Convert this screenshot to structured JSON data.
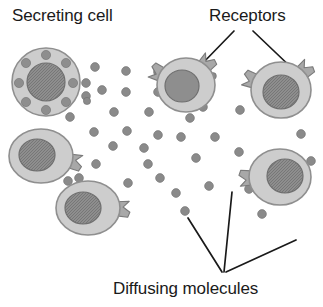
{
  "figure": {
    "background_color": "#ffffff",
    "width": 323,
    "height": 307
  },
  "labels": {
    "secreting_cell": "Secreting cell",
    "receptors": "Receptors",
    "diffusing_molecules": "Diffusing molecules"
  },
  "colors": {
    "cytoplasm_fill": "#cdcdcd",
    "cytoplasm_stroke": "#8f8f8f",
    "nucleus_fill": "#8e8e8e",
    "nucleus_stroke": "#6f6f6f",
    "vesicle_fill": "#8e8e8e",
    "molecule_fill": "#8a8a8a",
    "receptor_fill": "#a8a8a8",
    "receptor_stroke": "#7a7a7a",
    "leader_line": "#1a1a1a",
    "text": "#1a1a1a"
  },
  "chart_data": {
    "type": "diagram",
    "annotations": [
      {
        "text": "Secreting cell",
        "x": 12,
        "y": 6,
        "points_to": "secreting-cell"
      },
      {
        "text": "Receptors",
        "x": 209,
        "y": 6,
        "points_to": "receptors"
      },
      {
        "text": "Diffusing molecules",
        "x": 113,
        "y": 279,
        "points_to": "molecules"
      }
    ],
    "cells": [
      {
        "id": "secreting-cell",
        "role": "secreting",
        "cx": 46,
        "cy": 82,
        "rx": 34,
        "ry": 34,
        "nucleus": {
          "cx": 46,
          "cy": 82,
          "rx": 19,
          "ry": 19,
          "hatched": true
        },
        "vesicles": [
          {
            "cx": 46,
            "cy": 55,
            "r": 4.6
          },
          {
            "cx": 66,
            "cy": 63,
            "r": 4.6
          },
          {
            "cx": 73,
            "cy": 83,
            "r": 4.6
          },
          {
            "cx": 66,
            "cy": 102,
            "r": 4.6
          },
          {
            "cx": 46,
            "cy": 110,
            "r": 4.6
          },
          {
            "cx": 26,
            "cy": 102,
            "r": 4.6
          },
          {
            "cx": 19,
            "cy": 83,
            "r": 4.6
          },
          {
            "cx": 26,
            "cy": 63,
            "r": 4.6
          }
        ],
        "receptors": []
      },
      {
        "id": "target-cell-top-middle",
        "role": "target",
        "cx": 186,
        "cy": 85,
        "rx": 29,
        "ry": 27,
        "nucleus": {
          "cx": 182,
          "cy": 86,
          "rx": 17,
          "ry": 16,
          "hatched": false
        },
        "receptors": [
          {
            "angle": -48
          },
          {
            "angle": 205
          }
        ]
      },
      {
        "id": "target-cell-top-right",
        "role": "target",
        "cx": 281,
        "cy": 90,
        "rx": 30,
        "ry": 28,
        "nucleus": {
          "cx": 281,
          "cy": 92,
          "rx": 18,
          "ry": 17,
          "hatched": true
        },
        "receptors": [
          {
            "angle": -42
          },
          {
            "angle": 200
          }
        ]
      },
      {
        "id": "target-cell-mid-left",
        "role": "target",
        "cx": 41,
        "cy": 156,
        "rx": 32,
        "ry": 27,
        "nucleus": {
          "cx": 37,
          "cy": 155,
          "rx": 18,
          "ry": 16,
          "hatched": true
        },
        "receptors": [
          {
            "angle": 12
          }
        ]
      },
      {
        "id": "target-cell-bottom-left",
        "role": "target",
        "cx": 88,
        "cy": 208,
        "rx": 32,
        "ry": 27,
        "nucleus": {
          "cx": 83,
          "cy": 208,
          "rx": 18,
          "ry": 16,
          "hatched": true
        },
        "receptors": [
          {
            "angle": 2
          }
        ]
      },
      {
        "id": "target-cell-bottom-right",
        "role": "target",
        "cx": 280,
        "cy": 177,
        "rx": 31,
        "ry": 28,
        "nucleus": {
          "cx": 285,
          "cy": 176,
          "rx": 18,
          "ry": 17,
          "hatched": true
        },
        "receptors": [
          {
            "angle": 178
          }
        ]
      }
    ],
    "molecules": [
      {
        "cx": 95,
        "cy": 67,
        "r": 4.4
      },
      {
        "cx": 126,
        "cy": 71,
        "r": 4.4
      },
      {
        "cx": 158,
        "cy": 72,
        "r": 4.4
      },
      {
        "cx": 86,
        "cy": 83,
        "r": 4.4
      },
      {
        "cx": 102,
        "cy": 90,
        "r": 4.4
      },
      {
        "cx": 86,
        "cy": 96,
        "r": 4.4
      },
      {
        "cx": 87,
        "cy": 101,
        "r": 3.6
      },
      {
        "cx": 126,
        "cy": 92,
        "r": 4.4
      },
      {
        "cx": 158,
        "cy": 92,
        "r": 4.4
      },
      {
        "cx": 70,
        "cy": 117,
        "r": 4.4
      },
      {
        "cx": 114,
        "cy": 112,
        "r": 4.4
      },
      {
        "cx": 149,
        "cy": 112,
        "r": 4.4
      },
      {
        "cx": 190,
        "cy": 118,
        "r": 4.4
      },
      {
        "cx": 203,
        "cy": 107,
        "r": 4.4
      },
      {
        "cx": 240,
        "cy": 110,
        "r": 4.4
      },
      {
        "cx": 94,
        "cy": 132,
        "r": 4.4
      },
      {
        "cx": 127,
        "cy": 131,
        "r": 4.4
      },
      {
        "cx": 158,
        "cy": 135,
        "r": 4.4
      },
      {
        "cx": 181,
        "cy": 137,
        "r": 4.4
      },
      {
        "cx": 215,
        "cy": 137,
        "r": 4.4
      },
      {
        "cx": 301,
        "cy": 134,
        "r": 4.4
      },
      {
        "cx": 113,
        "cy": 146,
        "r": 4.4
      },
      {
        "cx": 144,
        "cy": 148,
        "r": 4.4
      },
      {
        "cx": 96,
        "cy": 164,
        "r": 4.4
      },
      {
        "cx": 148,
        "cy": 164,
        "r": 4.4
      },
      {
        "cx": 160,
        "cy": 178,
        "r": 4.4
      },
      {
        "cx": 196,
        "cy": 158,
        "r": 4.4
      },
      {
        "cx": 239,
        "cy": 152,
        "r": 4.4
      },
      {
        "cx": 128,
        "cy": 183,
        "r": 4.4
      },
      {
        "cx": 176,
        "cy": 193,
        "r": 4.4
      },
      {
        "cx": 209,
        "cy": 186,
        "r": 4.4
      },
      {
        "cx": 249,
        "cy": 189,
        "r": 4.4
      },
      {
        "cx": 185,
        "cy": 211,
        "r": 4.4
      },
      {
        "cx": 262,
        "cy": 214,
        "r": 4.4
      },
      {
        "cx": 68,
        "cy": 181,
        "r": 4.4
      },
      {
        "cx": 79,
        "cy": 178,
        "r": 4.4
      },
      {
        "cx": 311,
        "cy": 161,
        "r": 4.4
      },
      {
        "cx": 213,
        "cy": 76,
        "r": 3.4
      }
    ],
    "leader_lines": [
      {
        "id": "receptors-leader-left",
        "x1": 234,
        "y1": 31,
        "x2": 199,
        "y2": 67
      },
      {
        "id": "receptors-leader-right",
        "x1": 253,
        "y1": 31,
        "x2": 296,
        "y2": 72
      },
      {
        "id": "molecules-leader-left",
        "x1": 222,
        "y1": 272,
        "x2": 188,
        "y2": 218
      },
      {
        "id": "molecules-leader-mid",
        "x1": 224,
        "y1": 272,
        "x2": 232,
        "y2": 192
      },
      {
        "id": "molecules-leader-right",
        "x1": 226,
        "y1": 272,
        "x2": 296,
        "y2": 240
      }
    ]
  }
}
